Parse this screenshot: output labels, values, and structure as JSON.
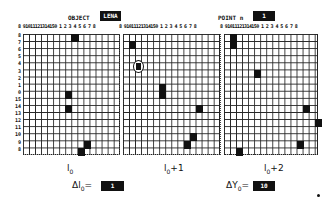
{
  "header": {
    "object_label": "OBJECT",
    "object_value": "LENA",
    "point_label": "POINT n",
    "point_value": "1"
  },
  "grid": {
    "column_labels": [
      "8",
      "9",
      "10",
      "11",
      "12",
      "13",
      "14",
      "15",
      "0",
      "1",
      "2",
      "3",
      "4",
      "5",
      "6",
      "7",
      "8"
    ],
    "column_label_text": "8 91011121314150 1 2 3 4 5 6 7 8",
    "row_labels": [
      "8",
      "7",
      "6",
      "5",
      "4",
      "3",
      "2",
      "1",
      "0",
      "15",
      "14",
      "13",
      "12",
      "11",
      "10",
      "9",
      "8"
    ],
    "panels": [
      {
        "name": "frame-l0",
        "caption": "l0",
        "filled_cells": [
          [
            0,
            8
          ],
          [
            8,
            7
          ],
          [
            10,
            7
          ],
          [
            15,
            10
          ],
          [
            16,
            9
          ]
        ]
      },
      {
        "name": "frame-l0-plus-1",
        "caption": "l0+1",
        "filled_cells": [
          [
            1,
            1
          ],
          [
            7,
            6
          ],
          [
            8,
            6
          ],
          [
            10,
            12
          ],
          [
            14,
            11
          ],
          [
            15,
            10
          ]
        ],
        "circled_cell": [
          4,
          2
        ]
      },
      {
        "name": "frame-l0-plus-2",
        "caption": "l0+2",
        "filled_cells": [
          [
            0,
            1
          ],
          [
            1,
            1
          ],
          [
            5,
            5
          ],
          [
            10,
            13
          ],
          [
            12,
            15
          ],
          [
            15,
            12
          ],
          [
            16,
            2
          ]
        ]
      }
    ]
  },
  "footer": {
    "caption_1": "l",
    "caption_1_sub": "0",
    "caption_2": "l",
    "caption_2_sub": "0",
    "caption_2_suffix": "+1",
    "caption_3": "l",
    "caption_3_sub": "0",
    "caption_3_suffix": "+2",
    "delta_l_label": "Δl",
    "delta_l_sub": "0",
    "delta_l_eq": "=",
    "delta_l_value": "1",
    "delta_y_label": "ΔY",
    "delta_y_sub": "0",
    "delta_y_eq": "=",
    "delta_y_value": "10"
  }
}
